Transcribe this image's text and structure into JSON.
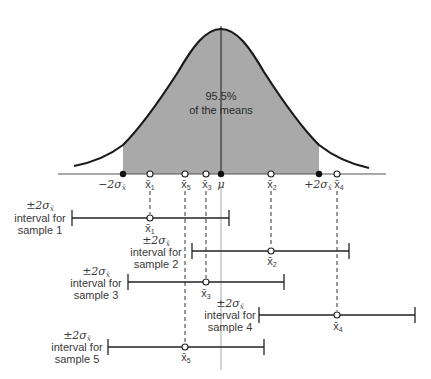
{
  "figure": {
    "center_text": {
      "line1": "95.5%",
      "line2": "of the means"
    },
    "axis_labels": {
      "minus_two_sigma": "−2σ",
      "plus_two_sigma": "+2σ",
      "sigma_sub": "x̄",
      "mu": "μ",
      "x1": "x̄",
      "x1_sub": "1",
      "x2": "x̄",
      "x2_sub": "2",
      "x3": "x̄",
      "x3_sub": "3",
      "x4": "x̄",
      "x4_sub": "4",
      "x5": "x̄",
      "x5_sub": "5"
    },
    "samples": [
      {
        "pm": "±2σ",
        "pm_sub": "x̄",
        "line2": "interval for",
        "line3": "sample 1",
        "mean_label": "x̄",
        "mean_sub": "1"
      },
      {
        "pm": "±2σ",
        "pm_sub": "x̄",
        "line2": "interval for",
        "line3": "sample 2",
        "mean_label": "x̄",
        "mean_sub": "2"
      },
      {
        "pm": "±2σ",
        "pm_sub": "x̄",
        "line2": "interval for",
        "line3": "sample 3",
        "mean_label": "x̄",
        "mean_sub": "3"
      },
      {
        "pm": "±2σ",
        "pm_sub": "x̄",
        "line2": "interval for",
        "line3": "sample 4",
        "mean_label": "x̄",
        "mean_sub": "4"
      },
      {
        "pm": "±2σ",
        "pm_sub": "x̄",
        "line2": "interval for",
        "line3": "sample 5",
        "mean_label": "x̄",
        "mean_sub": "5"
      }
    ],
    "colors": {
      "shade": "#a9a9a9",
      "curve": "#1a1a1a",
      "axis": "#555555",
      "text": "#3a3a3a"
    }
  }
}
